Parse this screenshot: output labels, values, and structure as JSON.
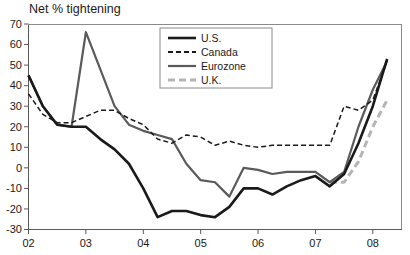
{
  "chart_data": {
    "type": "line",
    "title": "Net % tightening",
    "xlabel": "",
    "ylabel": "",
    "ylim": [
      -30,
      70
    ],
    "xlim": [
      2002.0,
      2008.5
    ],
    "yticks": [
      -30,
      -20,
      -10,
      0,
      10,
      20,
      30,
      40,
      50,
      60,
      70
    ],
    "ytick_labels": [
      "-30",
      "-20",
      "-10",
      "0",
      "10",
      "20",
      "30",
      "40",
      "50",
      "60",
      "70"
    ],
    "xticks": [
      2002,
      2003,
      2004,
      2005,
      2006,
      2007,
      2008
    ],
    "xtick_labels": [
      "02",
      "03",
      "04",
      "05",
      "06",
      "07",
      "08"
    ],
    "grid": false,
    "legend_position": "top-right",
    "series": [
      {
        "name": "U.S.",
        "color": "#1a1a1a",
        "style": "solid",
        "width": 2.6,
        "x": [
          2002.0,
          2002.25,
          2002.5,
          2002.75,
          2003.0,
          2003.25,
          2003.5,
          2003.75,
          2004.0,
          2004.25,
          2004.5,
          2004.75,
          2005.0,
          2005.25,
          2005.5,
          2005.75,
          2006.0,
          2006.25,
          2006.5,
          2006.75,
          2007.0,
          2007.25,
          2007.5,
          2007.75,
          2008.0,
          2008.25
        ],
        "y": [
          45,
          30,
          21,
          20,
          20,
          14,
          9,
          2,
          -10,
          -24,
          -21,
          -21,
          -23,
          -24,
          -19,
          -10,
          -10,
          -13,
          -9,
          -6,
          -4,
          -9,
          -3,
          12,
          30,
          53
        ]
      },
      {
        "name": "Canada",
        "color": "#1a1a1a",
        "style": "dashed",
        "width": 1.5,
        "x": [
          2002.0,
          2002.25,
          2002.5,
          2002.75,
          2003.0,
          2003.25,
          2003.5,
          2003.75,
          2004.0,
          2004.25,
          2004.5,
          2004.75,
          2005.0,
          2005.25,
          2005.5,
          2005.75,
          2006.0,
          2006.25,
          2006.5,
          2006.75,
          2007.0,
          2007.25,
          2007.5,
          2007.75,
          2008.0,
          2008.25
        ],
        "y": [
          36,
          26,
          22,
          22,
          25,
          28,
          28,
          24,
          21,
          14,
          12,
          16,
          15,
          11,
          13,
          11,
          10,
          11,
          11,
          11,
          11,
          11,
          30,
          28,
          33,
          52
        ]
      },
      {
        "name": "Eurozone",
        "color": "#5a5a5a",
        "style": "solid",
        "width": 2.2,
        "x": [
          2002.0,
          2002.25,
          2002.5,
          2002.75,
          2003.0,
          2003.25,
          2003.5,
          2003.75,
          2004.0,
          2004.25,
          2004.5,
          2004.75,
          2005.0,
          2005.25,
          2005.5,
          2005.75,
          2006.0,
          2006.25,
          2006.5,
          2006.75,
          2007.0,
          2007.25,
          2007.5,
          2007.75,
          2008.0,
          2008.25
        ],
        "y": [
          45,
          30,
          21,
          20,
          66,
          48,
          30,
          21,
          18,
          16,
          14,
          2,
          -6,
          -7,
          -14,
          0,
          -1,
          -3,
          -2,
          -2,
          -2,
          -7,
          -2,
          20,
          38,
          52
        ]
      },
      {
        "name": "U.K.",
        "color": "#b5b5b5",
        "style": "dashed",
        "width": 3.0,
        "x": [
          2007.25,
          2007.5,
          2007.75,
          2008.0,
          2008.25
        ],
        "y": [
          -7,
          -7,
          3,
          20,
          33
        ]
      }
    ]
  },
  "legend": {
    "items": [
      {
        "label": "U.S."
      },
      {
        "label": "Canada"
      },
      {
        "label": "Eurozone"
      },
      {
        "label": "U.K."
      }
    ]
  },
  "colors": {
    "axis": "#5a5a5a",
    "text": "#1a1a1a",
    "background": "#ffffff",
    "us": "#1a1a1a",
    "canada": "#1a1a1a",
    "eurozone": "#5a5a5a",
    "uk": "#b5b5b5"
  }
}
